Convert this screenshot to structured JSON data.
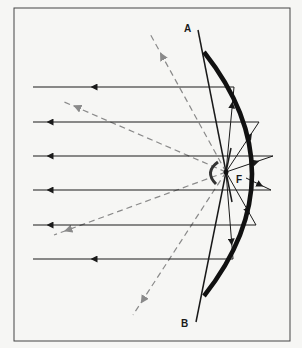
{
  "diagram": {
    "labels": {
      "point_a": "A",
      "point_b": "B",
      "focus": "F"
    },
    "elements": {
      "mirror": "parabolic-mirror",
      "source": "light-source-at-focus",
      "reflected_rays_count": 7,
      "unreflected_rays_count": 4
    },
    "colors": {
      "ink": "#1a1a1a",
      "dashed_ray": "#8a8a8a",
      "background": "#f6f6f4"
    }
  }
}
